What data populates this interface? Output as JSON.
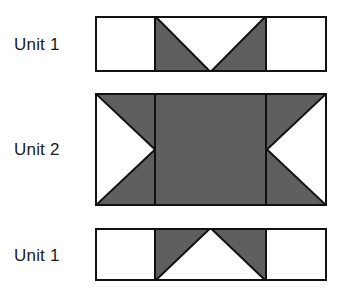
{
  "figure": {
    "background_color": "#ffffff",
    "shaded_color": "#5f5f5f",
    "unshaded_color": "#ffffff",
    "outline_color": "#111111",
    "outline_width_px": 2,
    "units": [
      {
        "id": "unit-top",
        "label": "Unit 1",
        "rect": {
          "x": 95,
          "y": 16,
          "width": 232,
          "height": 56
        },
        "columns": [
          {
            "name": "left-square",
            "fill": "unshaded"
          },
          {
            "name": "center-flying-geese",
            "fill": "shaded",
            "overlay": "white-triangle-pointing-down"
          },
          {
            "name": "right-square",
            "fill": "unshaded"
          }
        ],
        "divider_x": [
          155,
          266
        ]
      },
      {
        "id": "unit-middle",
        "label": "Unit 2",
        "rect": {
          "x": 95,
          "y": 93,
          "width": 232,
          "height": 113
        },
        "columns": [
          {
            "name": "left-flying-geese",
            "fill": "shaded",
            "overlay": "white-triangle-pointing-right"
          },
          {
            "name": "center-rectangle",
            "fill": "shaded"
          },
          {
            "name": "right-flying-geese",
            "fill": "shaded",
            "overlay": "white-triangle-pointing-left"
          }
        ],
        "divider_x": [
          155,
          266
        ]
      },
      {
        "id": "unit-bottom",
        "label": "Unit 1",
        "rect": {
          "x": 95,
          "y": 228,
          "width": 232,
          "height": 53
        },
        "columns": [
          {
            "name": "left-square",
            "fill": "unshaded"
          },
          {
            "name": "center-flying-geese",
            "fill": "shaded",
            "overlay": "white-triangle-pointing-up"
          },
          {
            "name": "right-square",
            "fill": "unshaded"
          }
        ],
        "divider_x": [
          155,
          266
        ]
      }
    ]
  },
  "labels": {
    "unit_top": "Unit 1",
    "unit_middle": "Unit 2",
    "unit_bottom": "Unit 1"
  }
}
